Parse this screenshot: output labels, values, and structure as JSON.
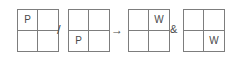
{
  "figure": {
    "line_color": "#7d7d7d",
    "text_color": "#4a4a4a",
    "background_color": "#ffffff",
    "grids": [
      {
        "name": "grid-1",
        "cells": [
          {
            "position": "top-left",
            "label": "P"
          },
          {
            "position": "top-right",
            "label": ""
          },
          {
            "position": "bottom-left",
            "label": ""
          },
          {
            "position": "bottom-right",
            "label": ""
          }
        ]
      },
      {
        "name": "grid-2",
        "cells": [
          {
            "position": "top-left",
            "label": ""
          },
          {
            "position": "top-right",
            "label": ""
          },
          {
            "position": "bottom-left",
            "label": "P"
          },
          {
            "position": "bottom-right",
            "label": ""
          }
        ]
      },
      {
        "name": "grid-3",
        "cells": [
          {
            "position": "top-left",
            "label": ""
          },
          {
            "position": "top-right",
            "label": "W"
          },
          {
            "position": "bottom-left",
            "label": ""
          },
          {
            "position": "bottom-right",
            "label": ""
          }
        ]
      },
      {
        "name": "grid-4",
        "cells": [
          {
            "position": "top-left",
            "label": ""
          },
          {
            "position": "top-right",
            "label": ""
          },
          {
            "position": "bottom-left",
            "label": ""
          },
          {
            "position": "bottom-right",
            "label": "W"
          }
        ]
      }
    ],
    "operators": {
      "slash": "/",
      "arrow": "→",
      "ampersand": "&"
    }
  }
}
